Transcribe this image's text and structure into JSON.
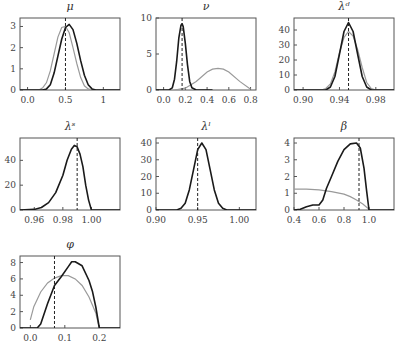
{
  "figure": {
    "layout": "3x3 grid, 7 panels",
    "legend": "none"
  },
  "colors": {
    "posterior": "#1a1a1a",
    "prior": "#9a9a9a",
    "marker": "#222222"
  },
  "chart_data": [
    {
      "id": "mu",
      "type": "line",
      "title": "μ",
      "xticks": [
        "0.0",
        "0.5",
        "1"
      ],
      "xtick_values": [
        0.0,
        0.5,
        1.0
      ],
      "xlim": [
        -0.1,
        1.22
      ],
      "yticks": [
        "0",
        "1",
        "2",
        "3"
      ],
      "ytick_values": [
        0,
        1,
        2,
        3
      ],
      "ylim": [
        0,
        3.4
      ],
      "vline": 0.5,
      "series": [
        {
          "name": "posterior",
          "x": [
            -0.1,
            0.2,
            0.25,
            0.3,
            0.35,
            0.4,
            0.45,
            0.5,
            0.55,
            0.6,
            0.65,
            0.7,
            0.75,
            0.8,
            0.85,
            0.9,
            1.22
          ],
          "y": [
            0,
            0,
            0.05,
            0.25,
            0.8,
            1.6,
            2.4,
            2.95,
            3.1,
            2.85,
            2.2,
            1.4,
            0.7,
            0.25,
            0.05,
            0,
            0
          ]
        },
        {
          "name": "prior",
          "x": [
            -0.1,
            0.15,
            0.2,
            0.25,
            0.3,
            0.35,
            0.4,
            0.45,
            0.5,
            0.55,
            0.6,
            0.65,
            0.7,
            0.75,
            0.8,
            0.85,
            1.22
          ],
          "y": [
            0,
            0,
            0.1,
            0.35,
            0.9,
            1.7,
            2.5,
            2.95,
            3.0,
            2.7,
            2.0,
            1.25,
            0.6,
            0.2,
            0.05,
            0,
            0
          ]
        }
      ]
    },
    {
      "id": "nu",
      "type": "line",
      "title": "ν",
      "xticks": [
        "0.0",
        "0.2",
        "0.4",
        "0.6",
        "0.8"
      ],
      "xtick_values": [
        0.0,
        0.2,
        0.4,
        0.6,
        0.8
      ],
      "xlim": [
        -0.07,
        0.85
      ],
      "yticks": [
        "0",
        "5",
        "10"
      ],
      "ytick_values": [
        0,
        5,
        10
      ],
      "ylim": [
        0,
        10
      ],
      "vline": 0.17,
      "series": [
        {
          "name": "posterior",
          "x": [
            -0.07,
            0.05,
            0.08,
            0.1,
            0.12,
            0.14,
            0.16,
            0.17,
            0.18,
            0.2,
            0.22,
            0.24,
            0.26,
            0.3,
            0.45
          ],
          "y": [
            0,
            0,
            0.3,
            1.5,
            4,
            7.2,
            9.0,
            9.2,
            8.8,
            6.5,
            3.5,
            1.2,
            0.3,
            0,
            0
          ]
        },
        {
          "name": "prior",
          "x": [
            0.1,
            0.2,
            0.3,
            0.4,
            0.45,
            0.5,
            0.55,
            0.6,
            0.7,
            0.8
          ],
          "y": [
            0,
            0.25,
            1.2,
            2.5,
            2.9,
            3.0,
            2.9,
            2.5,
            1.2,
            0.1
          ]
        }
      ]
    },
    {
      "id": "lambda_d",
      "type": "line",
      "title": "λᵈ",
      "xticks": [
        "0.90",
        "0.94",
        "0.98"
      ],
      "xtick_values": [
        0.9,
        0.94,
        0.98
      ],
      "xlim": [
        0.89,
        1.0
      ],
      "yticks": [
        "0",
        "10",
        "20",
        "30",
        "40"
      ],
      "ytick_values": [
        0,
        10,
        20,
        30,
        40
      ],
      "ylim": [
        0,
        48
      ],
      "vline": 0.95,
      "series": [
        {
          "name": "posterior",
          "x": [
            0.89,
            0.925,
            0.93,
            0.935,
            0.94,
            0.945,
            0.95,
            0.955,
            0.96,
            0.965,
            0.97,
            0.975,
            1.0
          ],
          "y": [
            0,
            0,
            2,
            9,
            24,
            39,
            45,
            39,
            24,
            9,
            2,
            0,
            0
          ]
        },
        {
          "name": "prior",
          "x": [
            0.89,
            0.92,
            0.925,
            0.93,
            0.935,
            0.94,
            0.945,
            0.95,
            0.955,
            0.96,
            0.965,
            0.97,
            0.975,
            0.98,
            1.0
          ],
          "y": [
            0,
            0,
            1,
            4,
            12,
            25,
            35,
            39,
            36,
            27,
            15,
            5,
            1,
            0,
            0
          ]
        }
      ]
    },
    {
      "id": "lambda_s",
      "type": "line",
      "title": "λˢ",
      "xticks": [
        "0.96",
        "0.98",
        "1.00"
      ],
      "xtick_values": [
        0.96,
        0.98,
        1.0
      ],
      "xlim": [
        0.95,
        1.02
      ],
      "yticks": [
        "0",
        "20",
        "40"
      ],
      "ytick_values": [
        0,
        20,
        40
      ],
      "ylim": [
        0,
        58
      ],
      "vline": 0.99,
      "series": [
        {
          "name": "posterior",
          "x": [
            0.95,
            0.96,
            0.965,
            0.97,
            0.975,
            0.98,
            0.983,
            0.986,
            0.988,
            0.99,
            0.992,
            0.994,
            0.996,
            0.998,
            1.0,
            1.02
          ],
          "y": [
            0,
            0.5,
            2,
            6,
            14,
            28,
            40,
            49,
            52,
            51,
            45,
            35,
            20,
            8,
            0,
            0
          ]
        }
      ]
    },
    {
      "id": "lambda_l",
      "type": "line",
      "title": "λˡ",
      "xticks": [
        "0.90",
        "0.95",
        "1.00"
      ],
      "xtick_values": [
        0.9,
        0.95,
        1.0
      ],
      "xlim": [
        0.9,
        1.02
      ],
      "yticks": [
        "0",
        "10",
        "20",
        "30",
        "40"
      ],
      "ytick_values": [
        0,
        10,
        20,
        30,
        40
      ],
      "ylim": [
        0,
        43
      ],
      "vline": 0.95,
      "series": [
        {
          "name": "posterior",
          "x": [
            0.9,
            0.925,
            0.93,
            0.935,
            0.94,
            0.945,
            0.95,
            0.955,
            0.96,
            0.965,
            0.97,
            0.975,
            0.98,
            0.985,
            1.02
          ],
          "y": [
            0,
            0,
            1,
            4,
            12,
            24,
            36,
            40,
            36,
            24,
            12,
            4,
            1,
            0,
            0
          ]
        }
      ]
    },
    {
      "id": "beta",
      "type": "line",
      "title": "β",
      "xticks": [
        "0.4",
        "0.6",
        "0.8",
        "1.0"
      ],
      "xtick_values": [
        0.4,
        0.6,
        0.8,
        1.0
      ],
      "xlim": [
        0.4,
        1.2
      ],
      "yticks": [
        "0",
        "1",
        "2",
        "3",
        "4"
      ],
      "ytick_values": [
        0,
        1,
        2,
        3,
        4
      ],
      "ylim": [
        0,
        4.3
      ],
      "vline": 0.92,
      "series": [
        {
          "name": "posterior",
          "x": [
            0.4,
            0.45,
            0.5,
            0.55,
            0.6,
            0.63,
            0.66,
            0.7,
            0.75,
            0.8,
            0.85,
            0.9,
            0.93,
            0.96,
            0.98,
            1.0,
            1.2
          ],
          "y": [
            0,
            0.05,
            0.2,
            0.3,
            0.3,
            0.6,
            1.3,
            2.0,
            2.9,
            3.6,
            3.95,
            4.0,
            3.7,
            2.5,
            1.2,
            0,
            0
          ]
        },
        {
          "name": "prior",
          "x": [
            0.4,
            0.5,
            0.6,
            0.7,
            0.8,
            0.85,
            0.9,
            0.95,
            1.0,
            1.02
          ],
          "y": [
            1.25,
            1.25,
            1.2,
            1.1,
            0.95,
            0.8,
            0.6,
            0.35,
            0.05,
            0
          ]
        }
      ]
    },
    {
      "id": "phi",
      "type": "line",
      "title": "φ",
      "xticks": [
        "0.0",
        "0.1",
        "0.2"
      ],
      "xtick_values": [
        0.0,
        0.1,
        0.2
      ],
      "xlim": [
        -0.03,
        0.26
      ],
      "yticks": [
        "0",
        "2",
        "4",
        "6",
        "8"
      ],
      "ytick_values": [
        0,
        2,
        4,
        6,
        8
      ],
      "ylim": [
        0,
        8.8
      ],
      "vline": 0.07,
      "series": [
        {
          "name": "posterior",
          "x": [
            -0.03,
            0.02,
            0.03,
            0.05,
            0.07,
            0.09,
            0.11,
            0.12,
            0.13,
            0.15,
            0.17,
            0.18,
            0.19,
            0.2,
            0.26
          ],
          "y": [
            0,
            0,
            0.5,
            3,
            5.2,
            6.3,
            7.5,
            8.1,
            8.1,
            7.6,
            5.8,
            4.5,
            2.5,
            0,
            0
          ]
        },
        {
          "name": "prior",
          "x": [
            0.0,
            0.01,
            0.03,
            0.05,
            0.07,
            0.09,
            0.11,
            0.13,
            0.15,
            0.17,
            0.19,
            0.2
          ],
          "y": [
            1.0,
            2.6,
            4.4,
            5.5,
            6.1,
            6.4,
            6.4,
            6.0,
            5.2,
            3.8,
            1.8,
            0
          ]
        }
      ]
    }
  ]
}
